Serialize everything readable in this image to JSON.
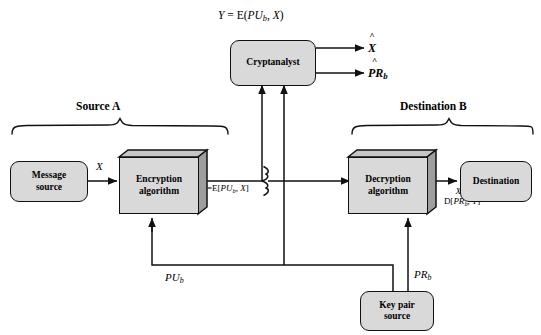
{
  "diagram": {
    "top_formula": {
      "lhs": "Y",
      "eq": "=",
      "rhs_fn": "E(",
      "rhs_key": "PU",
      "rhs_key_sub": "b",
      "rhs_sep": ", ",
      "rhs_msg": "X",
      "rhs_close": ")"
    },
    "sections": {
      "source": "Source A",
      "destination": "Destination B"
    },
    "nodes": {
      "message_source": "Message\nsource",
      "message_source_line1": "Message",
      "message_source_line2": "source",
      "encryption": "Encryption algorithm",
      "encryption_line1": "Encryption",
      "encryption_line2": "algorithm",
      "cryptanalyst": "Cryptanalyst",
      "decryption_line1": "Decryption",
      "decryption_line2": "algorithm",
      "destination_box": "Destination",
      "keypair_line1": "Key pair",
      "keypair_line2": "source"
    },
    "edge_labels": {
      "plaintext_in": "X",
      "channel_lhs": "Y",
      "channel_eq": "=",
      "channel_fn": "E[",
      "channel_key": "PU",
      "channel_key_sub": "b",
      "channel_sep": ", ",
      "channel_msg": "X",
      "channel_close": "]",
      "plaintext_out_line1_lhs": "X",
      "plaintext_out_line1_eq": "=",
      "plaintext_out_fn": "D[",
      "plaintext_out_key": "PR",
      "plaintext_out_key_sub": "b",
      "plaintext_out_sep": ", ",
      "plaintext_out_msg": "Y",
      "plaintext_out_close": "]",
      "public_key": "PU",
      "public_key_sub": "b",
      "private_key": "PR",
      "private_key_sub": "b"
    },
    "cryptanalyst_outputs": {
      "guess_message": "X",
      "guess_message_hat": "^",
      "guess_key": "PR",
      "guess_key_sub": "b",
      "guess_key_hat": "^"
    },
    "colors": {
      "box_fill": "#d9d9d9",
      "box_side": "#9a9a9a",
      "box_top": "#c0c0c0",
      "stroke": "#111111",
      "background": "#ffffff"
    }
  }
}
